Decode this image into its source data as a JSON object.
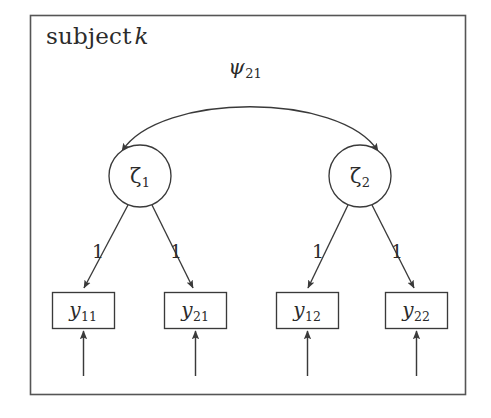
{
  "figure": {
    "type": "path-diagram",
    "panel_title_prefix": "subject",
    "panel_title_italic": "k",
    "background_color": "#ffffff",
    "stroke_color": "#3a3a3a",
    "frame_color": "#555555",
    "text_color": "#2b2b2b"
  },
  "covariance": {
    "label_symbol": "ψ",
    "label_subscript": "21",
    "arrow_style": "double-headed-curved",
    "connects": [
      "zeta-1",
      "zeta-2"
    ]
  },
  "latent_nodes": [
    {
      "id": "zeta-1",
      "symbol": "ζ",
      "subscript": "1",
      "shape": "circle",
      "cx": 140,
      "cy": 176,
      "r": 31
    },
    {
      "id": "zeta-2",
      "symbol": "ζ",
      "subscript": "2",
      "shape": "circle",
      "cx": 360,
      "cy": 176,
      "r": 31
    }
  ],
  "observed_nodes": [
    {
      "id": "y-11",
      "symbol": "y",
      "subscript": "11",
      "shape": "rect",
      "x": 52,
      "y": 292,
      "w": 62,
      "h": 36
    },
    {
      "id": "y-21",
      "symbol": "y",
      "subscript": "21",
      "shape": "rect",
      "x": 164,
      "y": 292,
      "w": 62,
      "h": 36
    },
    {
      "id": "y-12",
      "symbol": "y",
      "subscript": "12",
      "shape": "rect",
      "x": 276,
      "y": 292,
      "w": 62,
      "h": 36
    },
    {
      "id": "y-22",
      "symbol": "y",
      "subscript": "22",
      "shape": "rect",
      "x": 385,
      "y": 292,
      "w": 62,
      "h": 36
    }
  ],
  "loading_paths": [
    {
      "id": "path-zeta1-y11",
      "from": "zeta-1",
      "to": "y-11",
      "label": "1",
      "label_x": 98,
      "label_y": 251
    },
    {
      "id": "path-zeta1-y21",
      "from": "zeta-1",
      "to": "y-21",
      "label": "1",
      "label_x": 176,
      "label_y": 251
    },
    {
      "id": "path-zeta2-y12",
      "from": "zeta-2",
      "to": "y-12",
      "label": "1",
      "label_x": 318,
      "label_y": 251
    },
    {
      "id": "path-zeta2-y22",
      "from": "zeta-2",
      "to": "y-22",
      "label": "1",
      "label_x": 397,
      "label_y": 251
    }
  ],
  "residual_arrows": [
    {
      "id": "residual-y-11",
      "target": "y-11",
      "x": 83,
      "y_start": 375,
      "y_end": 332
    },
    {
      "id": "residual-y-21",
      "target": "y-21",
      "x": 195,
      "y_start": 375,
      "y_end": 332
    },
    {
      "id": "residual-y-12",
      "target": "y-12",
      "x": 307,
      "y_start": 375,
      "y_end": 332
    },
    {
      "id": "residual-y-22",
      "target": "y-22",
      "x": 416,
      "y_start": 375,
      "y_end": 332
    }
  ],
  "frame": {
    "x": 30,
    "y": 15,
    "w": 436,
    "h": 380
  }
}
